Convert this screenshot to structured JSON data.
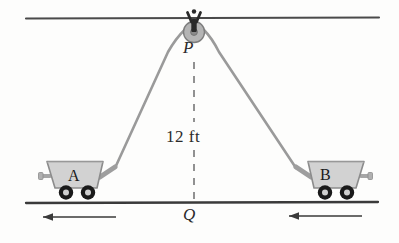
{
  "figure": {
    "background_color": "#fdfdfc"
  },
  "labels": {
    "pulley_point": "P",
    "ground_point": "Q",
    "height": "12 ft",
    "cart_a": "A",
    "cart_b": "B"
  },
  "icons": {
    "pulley": "pulley-icon",
    "hook": "ceiling-hook-icon",
    "cart_a": "mine-cart-icon",
    "cart_b": "mine-cart-icon",
    "arrow_left_a": "arrow-left-icon",
    "arrow_left_b": "arrow-left-icon"
  },
  "colors": {
    "line_dark": "#3a3a3a",
    "rope_gray": "#9a9a9a",
    "cart_fill": "#d2d2d2",
    "cart_stroke": "#8c8c8c",
    "wheel_black": "#1a1a1a",
    "wheel_hub": "#cfcfcf",
    "pulley_fill": "#b4b4b4",
    "pulley_stroke": "#7d7d7d",
    "hook_dark": "#2a2a2a",
    "dash_gray": "#6e6e6e",
    "text": "#2b2b2b"
  },
  "geometry": {
    "ceiling_y": 18,
    "ground_y": 203,
    "pulley_x": 194,
    "pulley_y": 32,
    "height_value": 12,
    "height_unit": "ft"
  },
  "motion": {
    "cart_a_direction": "left",
    "cart_b_direction": "left"
  }
}
